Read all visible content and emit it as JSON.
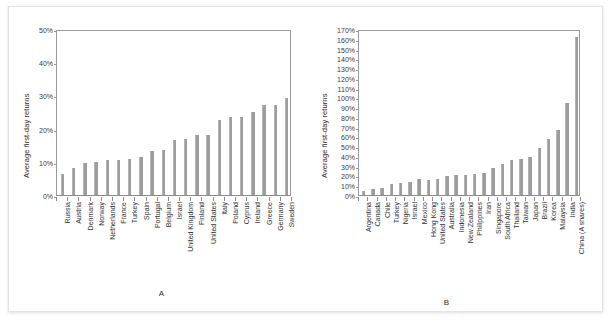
{
  "figure": {
    "bar_color": "#9d9d9d",
    "axis_color": "#8c8c8c",
    "background": "#ffffff"
  },
  "chart_data": [
    {
      "type": "bar",
      "panel_label": "A",
      "title": "",
      "xlabel": "",
      "ylabel": "Average first-day returns",
      "ylim": [
        0,
        50
      ],
      "ytick_labels": [
        "0%",
        "10%",
        "20%",
        "30%",
        "40%",
        "50%"
      ],
      "ytick_values": [
        0,
        10,
        20,
        30,
        40,
        50
      ],
      "grid": false,
      "legend": "none",
      "categories": [
        "Russia",
        "Austria",
        "Denmark",
        "Norway",
        "Netherlands",
        "France",
        "Turkey",
        "Spain",
        "Portugal",
        "Belgium",
        "Israel",
        "United Kingdom",
        "Finland",
        "United States",
        "Italy",
        "Poland",
        "Cyprus",
        "Ireland",
        "Greece",
        "Germany",
        "Sweden"
      ],
      "values": [
        6.3,
        8.2,
        9.5,
        10.0,
        10.4,
        10.6,
        10.7,
        11.3,
        13.2,
        13.5,
        16.5,
        16.8,
        18.0,
        18.1,
        22.7,
        23.5,
        23.5,
        24.9,
        27.0,
        27.0,
        29.1
      ]
    },
    {
      "type": "bar",
      "panel_label": "B",
      "title": "",
      "xlabel": "",
      "ylabel": "Average first-day returns",
      "ylim": [
        0,
        170
      ],
      "ytick_labels": [
        "0%",
        "10%",
        "20%",
        "30%",
        "40%",
        "50%",
        "60%",
        "70%",
        "80%",
        "90%",
        "100%",
        "110%",
        "120%",
        "130%",
        "140%",
        "150%",
        "160%",
        "170%"
      ],
      "ytick_values": [
        0,
        10,
        20,
        30,
        40,
        50,
        60,
        70,
        80,
        90,
        100,
        110,
        120,
        130,
        140,
        150,
        160,
        170
      ],
      "grid": false,
      "legend": "none",
      "categories": [
        "Argentina",
        "Canada",
        "Chile",
        "Turkey",
        "Nigeria",
        "Israel",
        "Mexico",
        "Hong Kong",
        "United States",
        "Australia",
        "Indonesia",
        "New Zealand",
        "Philippines",
        "Iran",
        "Singapore",
        "South Africa",
        "Thailand",
        "Taiwan",
        "Japan",
        "Brazil",
        "Korea",
        "Malaysia",
        "India",
        "China (A shares)"
      ],
      "values": [
        4.2,
        6.5,
        7.4,
        10.8,
        12.7,
        13.8,
        15.9,
        15.8,
        16.9,
        19.8,
        20.2,
        20.3,
        21.2,
        22.4,
        27.4,
        32.1,
        36.0,
        37.0,
        39.1,
        47.8,
        57.0,
        67.0,
        94.0,
        162.0
      ]
    }
  ]
}
